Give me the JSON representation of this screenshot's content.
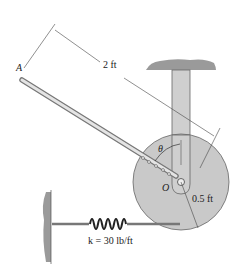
{
  "figure": {
    "labels": {
      "point_a": "A",
      "length": "2 ft",
      "angle": "θ",
      "pivot": "O",
      "radius": "0.5 ft",
      "spring": "k = 30 lb/ft"
    },
    "colors": {
      "disk": "#c9c9c9",
      "rod": "#cfcfcf",
      "outline": "#555555",
      "ground": "#9a9a9a"
    }
  }
}
